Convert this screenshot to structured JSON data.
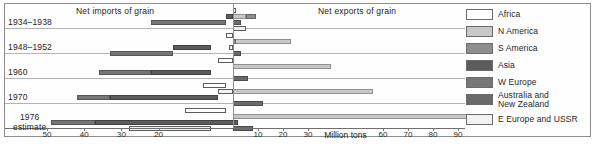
{
  "titles": {
    "left_side": "Net imports of grain",
    "right_side": "Net exports of grain",
    "axis_unit": "Million tons"
  },
  "legend": {
    "items": [
      {
        "label": "Africa",
        "key": "africa",
        "color": "#ffffff"
      },
      {
        "label": "N America",
        "key": "n-america",
        "color": "#c8c8c8"
      },
      {
        "label": "S America",
        "key": "s-america",
        "color": "#8e8e8e"
      },
      {
        "label": "Asia",
        "key": "asia",
        "color": "#5c5c5c"
      },
      {
        "label": "W Europe",
        "key": "w-europe",
        "color": "#767676"
      },
      {
        "label": "Australia and\nNew Zealand",
        "key": "anz",
        "color": "#6a6a6a"
      },
      {
        "label": "E Europe and USSR",
        "key": "e-europe",
        "color": "#f2f2f2"
      }
    ]
  },
  "axis": {
    "ticks": [
      {
        "label": "50",
        "value": -50
      },
      {
        "label": "40",
        "value": -40
      },
      {
        "label": "30",
        "value": -30
      },
      {
        "label": "20",
        "value": -20
      },
      {
        "label": "10",
        "value": 10
      },
      {
        "label": "20",
        "value": 20
      },
      {
        "label": "30",
        "value": 30
      },
      {
        "label": "60",
        "value": 60
      },
      {
        "label": "70",
        "value": 70
      },
      {
        "label": "80",
        "value": 80
      },
      {
        "label": "90",
        "value": 90
      }
    ],
    "unit_label_value": 45,
    "min": -52,
    "max": 94
  },
  "rows": [
    {
      "label": "1934–1938",
      "label_lines": [
        "1934–1938"
      ]
    },
    {
      "label": "1948–1952",
      "label_lines": [
        "1948–1952"
      ]
    },
    {
      "label": "1960",
      "label_lines": [
        "1960"
      ]
    },
    {
      "label": "1970",
      "label_lines": [
        "1970"
      ]
    },
    {
      "label": "1976 estimate",
      "label_lines": [
        "1976",
        "estimate"
      ]
    }
  ],
  "chart_data": {
    "type": "bar",
    "orientation": "horizontal-diverging",
    "xlabel": "Million tons",
    "ylabel": "",
    "xlim": [
      -52,
      94
    ],
    "grid": false,
    "legend_position": "right",
    "annotations": [
      "Net imports of grain",
      "Net exports of grain"
    ],
    "categories": [
      "1934–1938",
      "1948–1952",
      "1960",
      "1970",
      "1976 estimate"
    ],
    "note": "Negative values = net imports (bars extend left of zero); positive values = net exports (bars extend right of zero).",
    "series": [
      {
        "name": "Africa",
        "values": [
          1,
          0,
          -2,
          -5,
          -10
        ]
      },
      {
        "name": "N America",
        "values": [
          5,
          23,
          39,
          56,
          94
        ]
      },
      {
        "name": "S America",
        "values": [
          9,
          1,
          0,
          0,
          -3
        ]
      },
      {
        "name": "Asia",
        "values": [
          -2,
          -6,
          -17,
          -37,
          -47
        ]
      },
      {
        "name": "W Europe",
        "values": [
          -24,
          -22,
          -25,
          -22,
          -17
        ]
      },
      {
        "name": "Australia and New Zealand",
        "values": [
          3,
          3,
          6,
          12,
          8
        ]
      },
      {
        "name": "E Europe and USSR",
        "values": [
          5,
          -1,
          0,
          -2,
          -27
        ]
      }
    ]
  },
  "bars": [
    {
      "row": 0,
      "series": "Africa",
      "from": 0,
      "to": 1,
      "track": 0
    },
    {
      "row": 0,
      "series": "N America",
      "from": 0,
      "to": 5,
      "track": 1
    },
    {
      "row": 0,
      "series": "S America",
      "from": 5,
      "to": 9,
      "track": 1
    },
    {
      "row": 0,
      "series": "Asia",
      "from": 0,
      "to": -2,
      "track": 1
    },
    {
      "row": 0,
      "series": "W Europe",
      "from": -2,
      "to": -22,
      "track": 2
    },
    {
      "row": 0,
      "series": "ANZ",
      "from": 0,
      "to": 3,
      "track": 2
    },
    {
      "row": 0,
      "series": "E Europe",
      "from": 0,
      "to": 5,
      "track": 3
    },
    {
      "row": 1,
      "series": "Africa",
      "from": 0,
      "to": -2,
      "track": 0
    },
    {
      "row": 1,
      "series": "N America",
      "from": 0,
      "to": 23,
      "track": 1
    },
    {
      "row": 1,
      "series": "S America",
      "from": 0,
      "to": 1,
      "track": 1
    },
    {
      "row": 1,
      "series": "Asia",
      "from": -6,
      "to": -16,
      "track": 2
    },
    {
      "row": 1,
      "series": "W Europe",
      "from": -16,
      "to": -33,
      "track": 3
    },
    {
      "row": 1,
      "series": "ANZ",
      "from": 0,
      "to": 3,
      "track": 3
    },
    {
      "row": 1,
      "series": "E Europe",
      "from": 0,
      "to": -1,
      "track": 2
    },
    {
      "row": 2,
      "series": "Africa",
      "from": 0,
      "to": -4,
      "track": 0
    },
    {
      "row": 2,
      "series": "N America",
      "from": 0,
      "to": 39,
      "track": 1
    },
    {
      "row": 2,
      "series": "Asia",
      "from": -6,
      "to": -22,
      "track": 2
    },
    {
      "row": 2,
      "series": "W Europe",
      "from": -22,
      "to": -36,
      "track": 2
    },
    {
      "row": 2,
      "series": "ANZ",
      "from": 0,
      "to": 6,
      "track": 3
    },
    {
      "row": 3,
      "series": "Africa",
      "from": -2,
      "to": -8,
      "track": 0
    },
    {
      "row": 3,
      "series": "N America",
      "from": 0,
      "to": 56,
      "track": 1
    },
    {
      "row": 3,
      "series": "E Europe",
      "from": 0,
      "to": -4,
      "track": 1
    },
    {
      "row": 3,
      "series": "Asia",
      "from": -4,
      "to": -33,
      "track": 2
    },
    {
      "row": 3,
      "series": "W Europe",
      "from": -33,
      "to": -42,
      "track": 2
    },
    {
      "row": 3,
      "series": "ANZ",
      "from": 0,
      "to": 12,
      "track": 3
    },
    {
      "row": 4,
      "series": "Africa",
      "from": -2,
      "to": -13,
      "track": 0
    },
    {
      "row": 4,
      "series": "N America",
      "from": 0,
      "to": 94,
      "track": 1
    },
    {
      "row": 4,
      "series": "Asia",
      "from": 2,
      "to": -37,
      "track": 2
    },
    {
      "row": 4,
      "series": "W Europe",
      "from": -37,
      "to": -49,
      "track": 2
    },
    {
      "row": 4,
      "series": "ANZ",
      "from": 0,
      "to": 8,
      "track": 3
    },
    {
      "row": 4,
      "series": "E Europe",
      "from": -6,
      "to": -28,
      "track": 3
    }
  ]
}
